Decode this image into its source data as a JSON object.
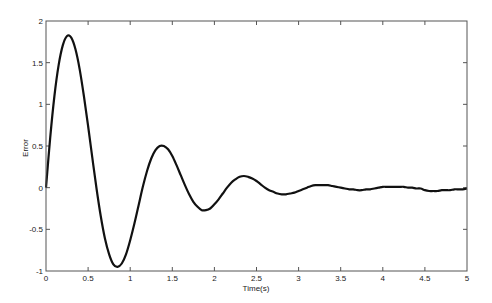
{
  "chart_data": {
    "type": "line",
    "title": "",
    "xlabel": "Time(s)",
    "ylabel": "Error",
    "xlim": [
      0,
      5
    ],
    "ylim": [
      -1,
      2
    ],
    "xticks": [
      0,
      0.5,
      1,
      1.5,
      2,
      2.5,
      3,
      3.5,
      4,
      4.5,
      5
    ],
    "xtick_labels": [
      "0",
      "0.5",
      "1",
      "1.5",
      "2",
      "2.5",
      "3",
      "3.5",
      "4",
      "4.5",
      "5"
    ],
    "yticks": [
      -1,
      -0.5,
      0,
      0.5,
      1,
      1.5,
      2
    ],
    "ytick_labels": [
      "-1",
      "-0.5",
      "0",
      "0.5",
      "1",
      "1.5",
      "2"
    ],
    "grid": false,
    "legend": null,
    "line_color": "#111111",
    "series": [
      {
        "name": "Error",
        "x": [
          0,
          0.05,
          0.1,
          0.15,
          0.2,
          0.25,
          0.3,
          0.35,
          0.4,
          0.45,
          0.5,
          0.55,
          0.6,
          0.65,
          0.7,
          0.75,
          0.8,
          0.85,
          0.9,
          0.95,
          1,
          1.05,
          1.1,
          1.15,
          1.2,
          1.25,
          1.3,
          1.35,
          1.4,
          1.45,
          1.5,
          1.55,
          1.6,
          1.65,
          1.7,
          1.75,
          1.8,
          1.85,
          1.9,
          1.95,
          2,
          2.05,
          2.1,
          2.15,
          2.2,
          2.25,
          2.3,
          2.35,
          2.4,
          2.45,
          2.5,
          2.55,
          2.6,
          2.65,
          2.7,
          2.75,
          2.8,
          2.85,
          2.9,
          2.95,
          3,
          3.05,
          3.1,
          3.15,
          3.2,
          3.25,
          3.3,
          3.35,
          3.4,
          3.45,
          3.5,
          3.55,
          3.6,
          3.65,
          3.7,
          3.75,
          3.8,
          3.85,
          3.9,
          3.95,
          4,
          4.05,
          4.1,
          4.15,
          4.2,
          4.25,
          4.3,
          4.35,
          4.4,
          4.45,
          4.5,
          4.55,
          4.6,
          4.65,
          4.7,
          4.75,
          4.8,
          4.85,
          4.9,
          4.95,
          5
        ],
        "values": [
          0,
          0.6,
          1.1,
          1.47,
          1.71,
          1.82,
          1.8,
          1.66,
          1.42,
          1.1,
          0.74,
          0.36,
          -0.01,
          -0.34,
          -0.61,
          -0.8,
          -0.92,
          -0.95,
          -0.91,
          -0.8,
          -0.63,
          -0.43,
          -0.21,
          0.01,
          0.2,
          0.35,
          0.45,
          0.5,
          0.5,
          0.46,
          0.38,
          0.27,
          0.15,
          0.03,
          -0.08,
          -0.17,
          -0.23,
          -0.27,
          -0.27,
          -0.25,
          -0.2,
          -0.14,
          -0.07,
          0,
          0.06,
          0.1,
          0.13,
          0.14,
          0.13,
          0.11,
          0.08,
          0.04,
          0,
          -0.03,
          -0.05,
          -0.07,
          -0.08,
          -0.08,
          -0.07,
          -0.06,
          -0.04,
          -0.02,
          0,
          0.02,
          0.03,
          0.03,
          0.03,
          0.03,
          0.02,
          0.01,
          0,
          -0.01,
          -0.02,
          -0.02,
          -0.03,
          -0.03,
          -0.02,
          -0.02,
          -0.01,
          0,
          0.01,
          0.01,
          0.01,
          0.01,
          0.01,
          0.01,
          0,
          0,
          -0.01,
          -0.01,
          -0.03,
          -0.04,
          -0.04,
          -0.04,
          -0.03,
          -0.03,
          -0.03,
          -0.02,
          -0.02,
          -0.02,
          -0.01
        ]
      }
    ]
  }
}
